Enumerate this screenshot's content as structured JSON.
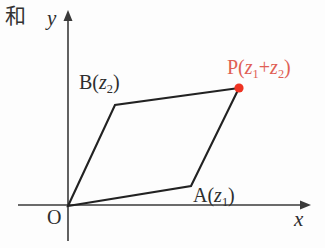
{
  "figure": {
    "corner_note": "和",
    "background_color": "#fdfdfd",
    "axis_color": "#3a3a3a",
    "shape_color": "#222222",
    "accent_color": "#ee3322",
    "accent_text_color": "#e06055"
  },
  "axes": {
    "x_label": "x",
    "y_label": "y",
    "origin_label": "O",
    "x_axis_start": [
      18,
      205
    ],
    "x_axis_end": [
      307,
      205
    ],
    "y_axis_start": [
      68,
      240
    ],
    "y_axis_end": [
      68,
      13
    ]
  },
  "points": {
    "origin": {
      "name": "O",
      "label": "O",
      "coords": [
        68,
        206
      ]
    },
    "a": {
      "name": "A",
      "label_prefix": "A(",
      "label_var": "z",
      "label_sub": "1",
      "label_suffix": ")",
      "label_full": "A(z₁)",
      "coords": [
        191,
        186
      ]
    },
    "b": {
      "name": "B",
      "label_prefix": "B(",
      "label_var": "z",
      "label_sub": "2",
      "label_suffix": ")",
      "label_full": "B(z₂)",
      "coords": [
        115,
        105
      ]
    },
    "p": {
      "name": "P",
      "label_prefix": "P(",
      "label_var1": "z",
      "label_sub1": "1",
      "label_op": "+",
      "label_var2": "z",
      "label_sub2": "2",
      "label_suffix": ")",
      "label_full": "P(z₁+z₂)",
      "coords": [
        239,
        88
      ],
      "marker": "filled-circle",
      "marker_color": "#ee3322"
    }
  },
  "chart_data": {
    "type": "scatter",
    "xlabel": "x",
    "ylabel": "y",
    "grid": false,
    "legend": false,
    "annotations": [
      "和"
    ],
    "vertices": [
      {
        "label": "O",
        "x": 0,
        "y": 0
      },
      {
        "label": "A(z₁)",
        "x": 123,
        "y": 20
      },
      {
        "label": "P(z₁+z₂)",
        "x": 171,
        "y": 118
      },
      {
        "label": "B(z₂)",
        "x": 47,
        "y": 101
      }
    ],
    "edges": [
      [
        "O",
        "A(z₁)"
      ],
      [
        "A(z₁)",
        "P(z₁+z₂)"
      ],
      [
        "P(z₁+z₂)",
        "B(z₂)"
      ],
      [
        "B(z₂)",
        "O"
      ]
    ]
  }
}
